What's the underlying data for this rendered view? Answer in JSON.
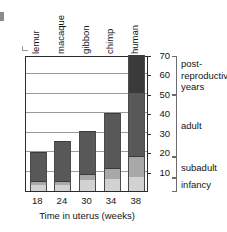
{
  "chart_data": {
    "type": "bar",
    "subtype": "stacked-bar",
    "title": "",
    "xlabel": "Time in uterus (weeks)",
    "ylabel": "",
    "categories": [
      "lemur",
      "macaque",
      "gibbon",
      "chimp",
      "human"
    ],
    "x": [
      18,
      24,
      30,
      34,
      38
    ],
    "xtick_labels": [
      "18",
      "24",
      "30",
      "34",
      "38"
    ],
    "ytick_labels": [
      "10",
      "20",
      "30",
      "40",
      "50",
      "60",
      "70"
    ],
    "yticks": [
      10,
      20,
      30,
      40,
      50,
      60,
      70
    ],
    "ylim": [
      0,
      70
    ],
    "grid": true,
    "legend": "none",
    "stage_labels": [
      {
        "name": "post-reproductive years",
        "lines": [
          "post-",
          "reproductive",
          "years"
        ],
        "range": [
          50,
          70
        ]
      },
      {
        "name": "adult",
        "lines": [
          "adult"
        ],
        "range": [
          18,
          50
        ]
      },
      {
        "name": "subadult",
        "lines": [
          "subadult"
        ],
        "range": [
          7,
          18
        ]
      },
      {
        "name": "infancy",
        "lines": [
          "infancy"
        ],
        "range": [
          0,
          7
        ]
      }
    ],
    "series": [
      {
        "name": "infancy",
        "color": "#d2d2d2",
        "values": [
          3.0,
          3.0,
          5.5,
          6.0,
          7.0
        ]
      },
      {
        "name": "subadult",
        "color": "#a8a8a8",
        "values": [
          2.0,
          2.0,
          3.5,
          6.0,
          11.0
        ]
      },
      {
        "name": "adult",
        "color": "#585858",
        "values": [
          15.0,
          21.0,
          22.0,
          28.0,
          33.0
        ]
      },
      {
        "name": "post-reproductive",
        "color": "#3a3a3a",
        "values": [
          0,
          0,
          0,
          0,
          19.0
        ]
      }
    ],
    "totals": [
      20.0,
      26.0,
      31.0,
      40.0,
      70.0
    ]
  }
}
